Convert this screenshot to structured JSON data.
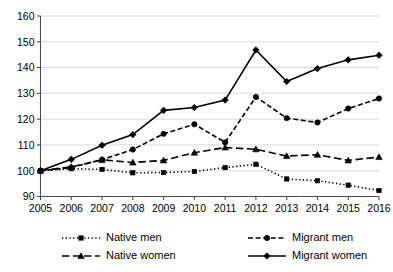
{
  "chart_data": {
    "type": "line",
    "title": "",
    "subtitle": "",
    "xlabel": "",
    "ylabel": "",
    "x": [
      2005,
      2006,
      2007,
      2008,
      2009,
      2010,
      2011,
      2012,
      2013,
      2014,
      2015,
      2016
    ],
    "xtick_labels": [
      "2005",
      "2006",
      "2007",
      "2008",
      "2009",
      "2010",
      "2011",
      "2012",
      "2013",
      "2014",
      "2015",
      "2016"
    ],
    "ytick_labels": [
      "90",
      "100",
      "110",
      "120",
      "130",
      "140",
      "150",
      "160"
    ],
    "yticks": [
      90,
      100,
      110,
      120,
      130,
      140,
      150,
      160
    ],
    "ylim": [
      90,
      160
    ],
    "xlim": [
      2005,
      2016
    ],
    "grid": true,
    "legend_position": "bottom",
    "series": [
      {
        "name": "Native men",
        "marker": "square",
        "dash": "dotted",
        "color": "#000000",
        "values": [
          100,
          100.8,
          100.5,
          99.2,
          99.3,
          99.7,
          101.2,
          102.5,
          96.8,
          96.1,
          94.4,
          92.3
        ]
      },
      {
        "name": "Native women",
        "marker": "triangle",
        "dash": "dashed-long",
        "color": "#000000",
        "values": [
          100,
          101.5,
          104.2,
          103.2,
          104.0,
          107.0,
          109.0,
          108.3,
          105.7,
          106.2,
          104.0,
          105.3
        ]
      },
      {
        "name": "Migrant men",
        "marker": "circle",
        "dash": "dashed",
        "color": "#000000",
        "values": [
          100,
          101.2,
          104.3,
          108.2,
          114.3,
          118.0,
          111.0,
          128.6,
          120.4,
          118.7,
          124.1,
          128.0
        ]
      },
      {
        "name": "Migrant women",
        "marker": "diamond",
        "dash": "solid",
        "color": "#000000",
        "values": [
          100,
          104.4,
          109.9,
          114.0,
          123.4,
          124.5,
          127.4,
          146.8,
          134.6,
          139.6,
          143.0,
          144.8
        ]
      }
    ]
  },
  "legend": {
    "items": [
      {
        "label": "Native men"
      },
      {
        "label": "Migrant men"
      },
      {
        "label": "Native women"
      },
      {
        "label": "Migrant women"
      }
    ]
  }
}
